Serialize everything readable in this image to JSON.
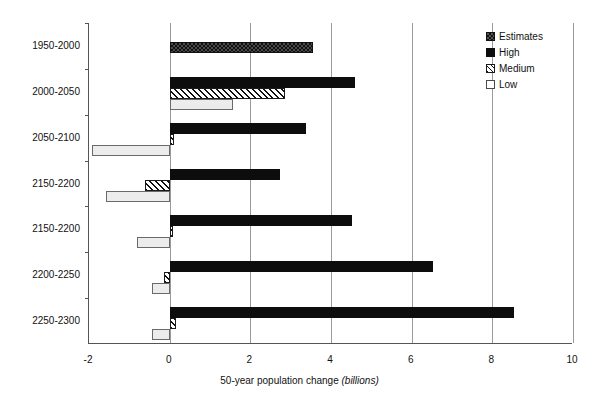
{
  "chart_data": {
    "type": "bar",
    "orientation": "horizontal",
    "title": "",
    "xlabel": "50-year population change (billions)",
    "xlabel_plain": "50-year population change",
    "xlabel_unit": "(billions)",
    "ylabel": "",
    "xlim": [
      -2,
      10
    ],
    "xticks": [
      -2,
      0,
      2,
      4,
      6,
      8,
      10
    ],
    "xtick_labels": [
      "-2",
      "0",
      "2",
      "4",
      "6",
      "8",
      "10"
    ],
    "grid": "vertical",
    "legend_position": "top-right",
    "categories": [
      "1950-2000",
      "2000-2050",
      "2050-2100",
      "2150-2200",
      "2150-2200",
      "2200-2250",
      "2250-2300"
    ],
    "series": [
      {
        "name": "Estimates",
        "pattern": "checkerboard",
        "color": "#333333",
        "values": [
          3.55,
          null,
          null,
          null,
          null,
          null,
          null
        ]
      },
      {
        "name": "High",
        "pattern": "solid",
        "color": "#0d0d0d",
        "values": [
          null,
          4.6,
          3.38,
          2.74,
          4.53,
          6.54,
          8.53
        ]
      },
      {
        "name": "Medium",
        "pattern": "diagonal-hatch",
        "color": "#ffffff",
        "values": [
          null,
          2.86,
          0.12,
          -0.62,
          0,
          -0.15,
          0.15
        ]
      },
      {
        "name": "Low",
        "pattern": "light-fill",
        "color": "#ececec",
        "values": [
          null,
          1.57,
          -1.92,
          -1.57,
          -0.8,
          -0.45,
          -0.45
        ]
      }
    ]
  },
  "legend": {
    "items": [
      {
        "label": "Estimates",
        "key": "estimates"
      },
      {
        "label": "High",
        "key": "high"
      },
      {
        "label": "Medium",
        "key": "medium"
      },
      {
        "label": "Low",
        "key": "low"
      }
    ]
  },
  "axis": {
    "x_title_main": "50-year population change ",
    "x_title_unit": "(billions)"
  }
}
